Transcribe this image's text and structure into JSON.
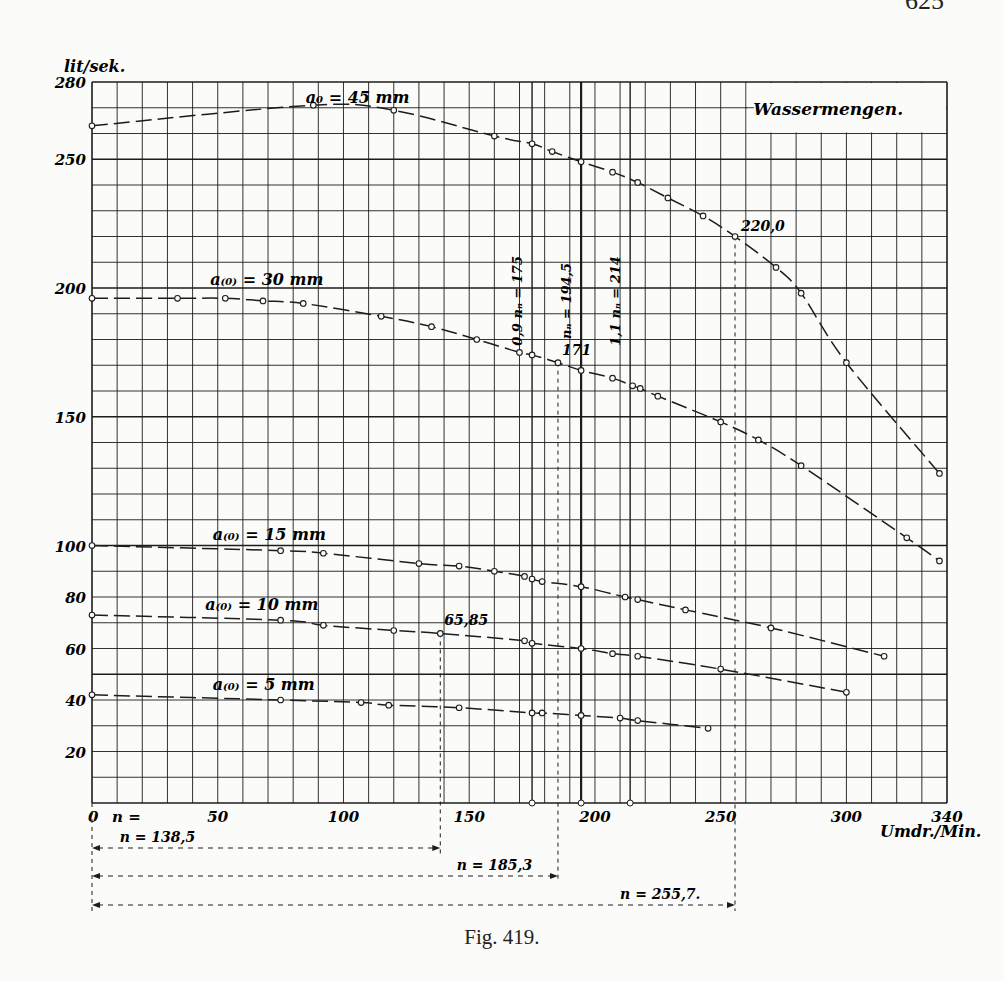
{
  "page": {
    "page_number": "625"
  },
  "figure": {
    "caption": "Fig. 419."
  },
  "chart_data": {
    "type": "line",
    "title": "Wassermengen.",
    "xlabel": "Umdr./Min.",
    "ylabel": "lit/sek.",
    "xlim": [
      0,
      340
    ],
    "ylim": [
      0,
      280
    ],
    "grid": true,
    "x_ticks": [
      0,
      50,
      100,
      150,
      200,
      250,
      300,
      340
    ],
    "y_ticks": [
      20,
      40,
      60,
      80,
      100,
      150,
      200,
      250,
      280
    ],
    "x_tick_prefix_label": "n =",
    "series": [
      {
        "name": "a0 = 45 mm",
        "label": "a₀ = 45 mm",
        "points": [
          [
            0,
            263
          ],
          [
            88,
            271
          ],
          [
            120,
            269
          ],
          [
            160,
            259
          ],
          [
            175,
            256
          ],
          [
            183,
            253
          ],
          [
            194.5,
            249
          ],
          [
            207,
            245
          ],
          [
            217,
            241
          ],
          [
            229,
            235
          ],
          [
            243,
            228
          ],
          [
            255.7,
            220
          ],
          [
            272,
            208
          ],
          [
            282,
            198
          ],
          [
            300,
            171
          ],
          [
            337,
            128
          ]
        ]
      },
      {
        "name": "a(0) = 30 mm",
        "label": "a₍₀₎ = 30 mm",
        "points": [
          [
            0,
            196
          ],
          [
            34,
            196
          ],
          [
            53,
            196
          ],
          [
            68,
            195
          ],
          [
            84,
            194
          ],
          [
            115,
            189
          ],
          [
            135,
            185
          ],
          [
            153,
            180
          ],
          [
            170,
            175
          ],
          [
            175,
            174
          ],
          [
            185.3,
            171
          ],
          [
            194.5,
            168
          ],
          [
            207,
            165
          ],
          [
            215,
            162
          ],
          [
            218,
            161
          ],
          [
            225,
            158
          ],
          [
            250,
            148
          ],
          [
            265,
            141
          ],
          [
            282,
            131
          ],
          [
            324,
            103
          ],
          [
            337,
            94
          ]
        ]
      },
      {
        "name": "a(0) = 15 mm",
        "label": "a₍₀₎ = 15 mm",
        "points": [
          [
            0,
            100
          ],
          [
            75,
            98
          ],
          [
            92,
            97
          ],
          [
            130,
            93
          ],
          [
            146,
            92
          ],
          [
            160,
            90
          ],
          [
            172,
            88
          ],
          [
            175,
            87
          ],
          [
            179,
            86
          ],
          [
            194.5,
            84
          ],
          [
            212,
            80
          ],
          [
            217,
            79
          ],
          [
            236,
            75
          ],
          [
            270,
            68
          ],
          [
            315,
            57
          ]
        ]
      },
      {
        "name": "a(0) = 10 mm",
        "label": "a₍₀₎ = 10 mm",
        "points": [
          [
            0,
            73
          ],
          [
            75,
            71
          ],
          [
            92,
            69
          ],
          [
            120,
            67
          ],
          [
            138.5,
            65.85
          ],
          [
            172,
            63
          ],
          [
            175,
            62
          ],
          [
            194.5,
            60
          ],
          [
            207,
            58
          ],
          [
            217,
            57
          ],
          [
            250,
            52
          ],
          [
            300,
            43
          ]
        ]
      },
      {
        "name": "a(0) = 5 mm",
        "label": "a₍₀₎ = 5 mm",
        "points": [
          [
            0,
            42
          ],
          [
            75,
            40
          ],
          [
            107,
            39
          ],
          [
            118,
            38
          ],
          [
            146,
            37
          ],
          [
            175,
            35
          ],
          [
            179,
            35
          ],
          [
            194.5,
            34
          ],
          [
            210,
            33
          ],
          [
            217,
            32
          ],
          [
            245,
            29
          ]
        ]
      }
    ],
    "vertical_markers": [
      {
        "x": 175,
        "label": "0,9 nₙ = 175"
      },
      {
        "x": 194.5,
        "label": "nₙ = 194,5"
      },
      {
        "x": 214,
        "label": "1,1 nₙ = 214"
      }
    ],
    "annotations": [
      {
        "text": "220,0",
        "x": 255.7,
        "y": 220
      },
      {
        "text": "171",
        "x": 185.3,
        "y": 171
      },
      {
        "text": "65,85",
        "x": 138.5,
        "y": 65.85
      }
    ],
    "dimension_lines": [
      {
        "label": "n = 138,5",
        "from": 0,
        "to": 138.5
      },
      {
        "label": "n = 185,3",
        "from": 0,
        "to": 185.3
      },
      {
        "label": "n = 255,7.",
        "from": 0,
        "to": 255.7
      }
    ]
  }
}
